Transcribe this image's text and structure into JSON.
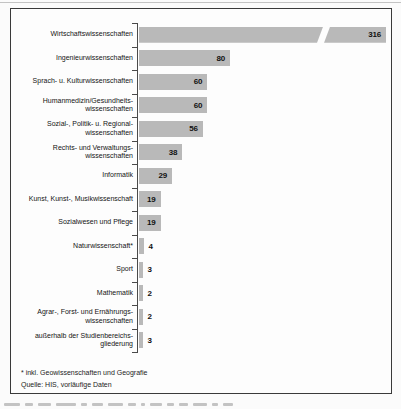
{
  "chart_data": {
    "type": "bar",
    "orientation": "horizontal",
    "title": "",
    "xlabel": "",
    "ylabel": "",
    "grid": false,
    "legend": false,
    "bar_color": "#b9b9b9",
    "categories": [
      "Wirtschaftswissenschaften",
      "Ingenieurwissenschaften",
      "Sprach- u. Kulturwissenschaften",
      "Humanmedizin/Gesundheitswissenschaften",
      "Sozial-, Politik- u. Regionalwissenschaften",
      "Rechts- und Verwaltungswissenschaften",
      "Informatik",
      "Kunst, Kunst-, Musikwissenschaft",
      "Sozialwesen und Pflege",
      "Naturwissenschaft*",
      "Sport",
      "Mathematik",
      "Agrar-, Forst- und Ernährungswissenschaften",
      "außerhalb der Studienbereichsgliederung"
    ],
    "values": [
      316,
      80,
      60,
      60,
      56,
      38,
      29,
      19,
      19,
      4,
      3,
      2,
      2,
      3
    ],
    "axis_break": {
      "category": "Wirtschaftswissenschaften",
      "value": 316
    },
    "footnote": "* inkl. Geowissenschaften und Geografie",
    "source": "Quelle: HIS, vorläufige Daten"
  },
  "rows": [
    {
      "label_lines": [
        "Wirtschaftswissenschaften"
      ],
      "value": 316,
      "value_label": "316",
      "broken": true
    },
    {
      "label_lines": [
        "Ingenieurwissenschaften"
      ],
      "value": 80,
      "value_label": "80"
    },
    {
      "label_lines": [
        "Sprach- u. Kulturwissenschaften"
      ],
      "value": 60,
      "value_label": "60"
    },
    {
      "label_lines": [
        "Humanmedizin/Gesundheits-",
        "wissenschaften"
      ],
      "value": 60,
      "value_label": "60"
    },
    {
      "label_lines": [
        "Sozial-, Politik- u. Regional-",
        "wissenschaften"
      ],
      "value": 56,
      "value_label": "56"
    },
    {
      "label_lines": [
        "Rechts- und Verwaltungs-",
        "wissenschaften"
      ],
      "value": 38,
      "value_label": "38"
    },
    {
      "label_lines": [
        "Informatik"
      ],
      "value": 29,
      "value_label": "29"
    },
    {
      "label_lines": [
        "Kunst, Kunst-, Musikwissenschaft"
      ],
      "value": 19,
      "value_label": "19"
    },
    {
      "label_lines": [
        "Sozialwesen und Pflege"
      ],
      "value": 19,
      "value_label": "19"
    },
    {
      "label_lines": [
        "Naturwissenschaft*"
      ],
      "value": 4,
      "value_label": "4"
    },
    {
      "label_lines": [
        "Sport"
      ],
      "value": 3,
      "value_label": "3"
    },
    {
      "label_lines": [
        "Mathematik"
      ],
      "value": 2,
      "value_label": "2"
    },
    {
      "label_lines": [
        "Agrar-, Forst- und Ernährungs-",
        "wissenschaften"
      ],
      "value": 2,
      "value_label": "2"
    },
    {
      "label_lines": [
        "außerhalb der Studienbereichs-",
        "gliederung"
      ],
      "value": 3,
      "value_label": "3"
    }
  ],
  "footer": {
    "footnote": "* inkl. Geowissenschaften und Geografie",
    "source": "Quelle: HIS, vorläufige Daten"
  }
}
